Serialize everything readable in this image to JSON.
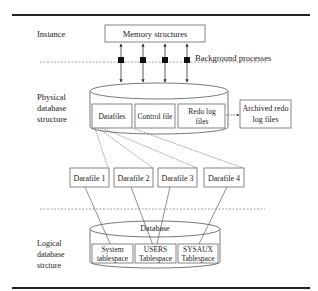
{
  "labels": {
    "instance": "Instance",
    "physical": [
      "Physical",
      "database",
      "structure"
    ],
    "logical": [
      "Logical",
      "database",
      "strcture"
    ],
    "background_processes": "Background processes"
  },
  "memory": {
    "label": "Memory structures"
  },
  "physical_db": {
    "files": [
      {
        "lines": [
          "Datafiles"
        ]
      },
      {
        "lines": [
          "Control file"
        ]
      },
      {
        "lines": [
          "Redo log",
          "files"
        ]
      }
    ],
    "archived": [
      "Archived redo",
      "log files"
    ]
  },
  "datafiles": [
    "Darafile 1",
    "Darafile 2",
    "Darafile 3",
    "Darafile 4"
  ],
  "logical_db": {
    "title": "Database",
    "tablespaces": [
      [
        "System",
        "tablespace"
      ],
      [
        "USERS",
        "Tablespace"
      ],
      [
        "SYSAUX",
        "Tablespace"
      ]
    ]
  },
  "colors": {
    "line": "#444444",
    "rule": "#222222",
    "text": "#222222"
  }
}
